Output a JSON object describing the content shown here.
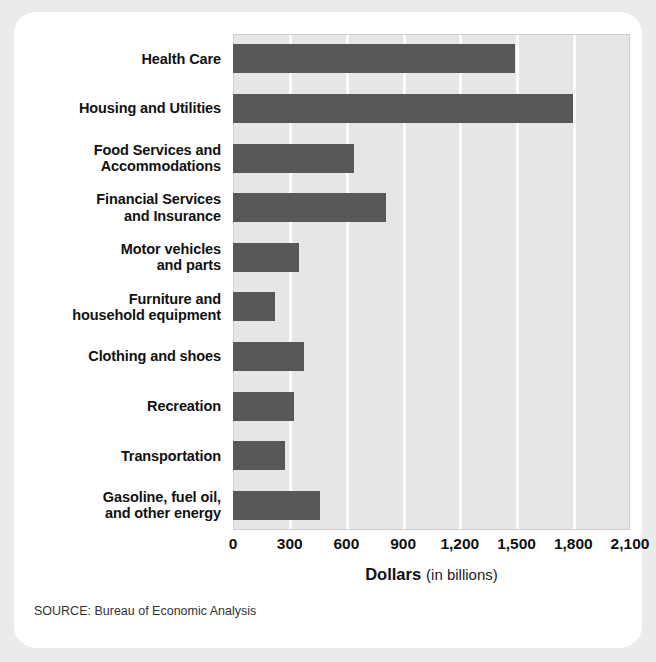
{
  "source_note": "SOURCE: Bureau of Economic Analysis",
  "axis_title": {
    "main": "Dollars",
    "sub": "(in billions)"
  },
  "colors": {
    "bar": "#585858",
    "plot_background": "#e6e6e6",
    "gridline": "#fbfbfb",
    "card": "#ffffff",
    "page_background": "#ebebeb",
    "text": "#111111"
  },
  "chart_data": {
    "type": "bar",
    "orientation": "horizontal",
    "title": "",
    "subtitle": "",
    "xlabel": "Dollars (in billions)",
    "ylabel": "",
    "xlim": [
      0,
      2100
    ],
    "grid": true,
    "legend": false,
    "tick_labels": [
      "0",
      "300",
      "600",
      "900",
      "1,200",
      "1,500",
      "1,800",
      "2,100"
    ],
    "ticks": [
      0,
      300,
      600,
      900,
      1200,
      1500,
      1800,
      2100
    ],
    "categories": [
      "Health Care",
      "Housing and Utilities",
      "Food Services and Accommodations",
      "Financial Services and Insurance",
      "Motor vehicles and parts",
      "Furniture and household equipment",
      "Clothing and shoes",
      "Recreation",
      "Transportation",
      "Gasoline, fuel oil, and other energy"
    ],
    "category_lines": [
      [
        "Health Care"
      ],
      [
        "Housing and Utilities"
      ],
      [
        "Food Services and",
        "Accommodations"
      ],
      [
        "Financial Services",
        "and Insurance"
      ],
      [
        "Motor vehicles",
        "and parts"
      ],
      [
        "Furniture and",
        "household equipment"
      ],
      [
        "Clothing and shoes"
      ],
      [
        "Recreation"
      ],
      [
        "Transportation"
      ],
      [
        "Gasoline, fuel oil,",
        "and other energy"
      ]
    ],
    "values": [
      1490,
      1800,
      640,
      810,
      350,
      220,
      375,
      325,
      275,
      460
    ]
  }
}
